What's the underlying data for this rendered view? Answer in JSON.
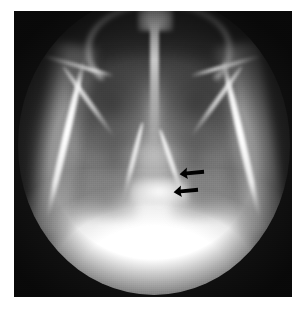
{
  "figure": {
    "kind": "radiograph",
    "modality": "X-ray",
    "projection": "submentovertex axial skull view",
    "caption": "",
    "background_color": "#ffffff",
    "plate_color": "#141414",
    "field_shape": "circular collimated field",
    "plate": {
      "x": 14,
      "y": 11,
      "width": 278,
      "height": 286
    }
  },
  "annotations": {
    "arrow_color": "#000000",
    "count": "2",
    "items": [
      {
        "name": "upper-arrow",
        "direction": "up-left",
        "x": 179,
        "y": 166,
        "label": ""
      },
      {
        "name": "lower-arrow",
        "direction": "up-left",
        "x": 173,
        "y": 184,
        "label": ""
      }
    ]
  },
  "anatomy": {
    "structures": [
      "nasal septum",
      "dental arch",
      "maxillary antrum left",
      "maxillary antrum right",
      "zygomatic arch left",
      "zygomatic arch right",
      "pterygoid plate left",
      "pterygoid plate right",
      "petrous temporal bone",
      "basiocciput",
      "occipital / cervical spine overlap"
    ]
  },
  "labels": {
    "overlay_text": "",
    "corner_marker": ""
  }
}
